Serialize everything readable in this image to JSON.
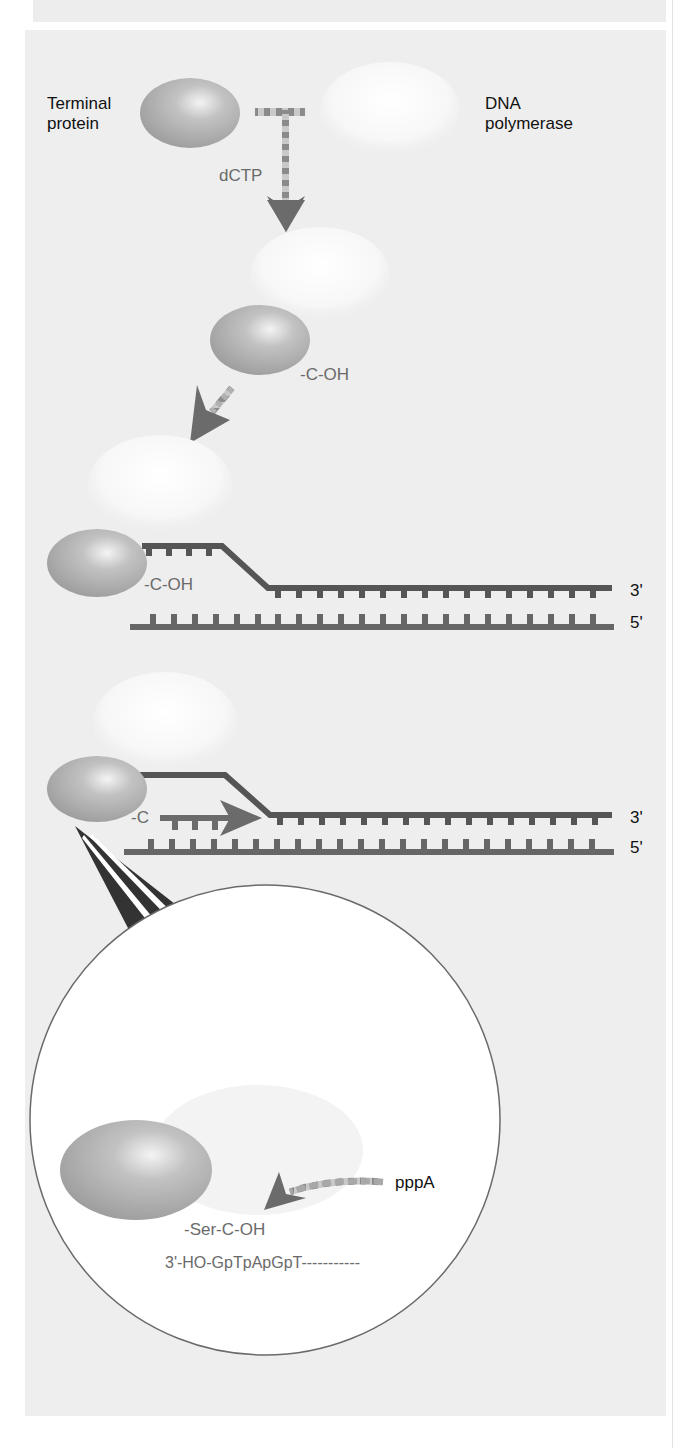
{
  "figure": {
    "stage1": {
      "terminal_protein_label_line1": "Terminal",
      "terminal_protein_label_line2": "protein",
      "dna_polymerase_label_line1": "DNA",
      "dna_polymerase_label_line2": "polymerase",
      "nucleotide_label": "dCTP"
    },
    "stage2": {
      "group_label": "-C-OH"
    },
    "stage3": {
      "group_label": "-C-OH",
      "strand_top_end": "3'",
      "strand_bottom_end": "5'"
    },
    "stage4": {
      "group_label": "-C",
      "strand_top_end": "3'",
      "strand_bottom_end": "5'"
    },
    "inset": {
      "nucleotide_label": "pppA",
      "linkage_label": "-Ser-C-OH",
      "sequence_label": "3'-HO-GpTpApGpT-----------"
    },
    "colors": {
      "panel_bg": "#eeeeee",
      "protein": "#a9a9a9",
      "dna_strand": "#5a5a5a",
      "dna_strand_bottom": "#7a7a7a",
      "arrow": "#6b6b6b",
      "gray_text": "#6a6a6a"
    }
  }
}
